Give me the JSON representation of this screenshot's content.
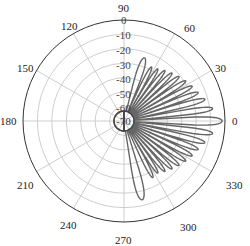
{
  "chart_data": {
    "type": "polar-line",
    "title": "",
    "theta_unit": "degrees",
    "angular_ticks": [
      0,
      30,
      60,
      90,
      120,
      150,
      180,
      210,
      240,
      270,
      300,
      330
    ],
    "radial_ticks": [
      0,
      -10,
      -20,
      -30,
      -40,
      -50,
      -60,
      -70
    ],
    "radial_range": [
      -70,
      0
    ],
    "radial_unit": "dB",
    "grid": true,
    "legend": null,
    "series": [
      {
        "name": "radiation pattern",
        "color": "#666666",
        "lobes": [
          {
            "angle": 0,
            "peak_db": -2,
            "half_width": 3.5
          },
          {
            "angle": 8,
            "peak_db": -8,
            "half_width": 2.6
          },
          {
            "angle": 15,
            "peak_db": -12,
            "half_width": 2.6
          },
          {
            "angle": 21,
            "peak_db": -15,
            "half_width": 2.6
          },
          {
            "angle": 27,
            "peak_db": -17,
            "half_width": 2.6
          },
          {
            "angle": 33,
            "peak_db": -19,
            "half_width": 2.6
          },
          {
            "angle": 39,
            "peak_db": -21,
            "half_width": 2.6
          },
          {
            "angle": 45,
            "peak_db": -23,
            "half_width": 2.6
          },
          {
            "angle": 51,
            "peak_db": -25,
            "half_width": 2.6
          },
          {
            "angle": 57,
            "peak_db": -27,
            "half_width": 2.6
          },
          {
            "angle": 63,
            "peak_db": -28,
            "half_width": 2.8
          },
          {
            "angle": 72,
            "peak_db": -24,
            "half_width": 4.5
          },
          {
            "angle": -8,
            "peak_db": -8,
            "half_width": 2.6
          },
          {
            "angle": -15,
            "peak_db": -12,
            "half_width": 2.6
          },
          {
            "angle": -21,
            "peak_db": -15,
            "half_width": 2.6
          },
          {
            "angle": -27,
            "peak_db": -17,
            "half_width": 2.6
          },
          {
            "angle": -33,
            "peak_db": -19,
            "half_width": 2.6
          },
          {
            "angle": -39,
            "peak_db": -21,
            "half_width": 2.6
          },
          {
            "angle": -45,
            "peak_db": -23,
            "half_width": 2.6
          },
          {
            "angle": -51,
            "peak_db": -25,
            "half_width": 2.6
          },
          {
            "angle": -57,
            "peak_db": -27,
            "half_width": 2.6
          },
          {
            "angle": -63,
            "peak_db": -26,
            "half_width": 2.8
          },
          {
            "angle": -77,
            "peak_db": -14,
            "half_width": 4.5
          }
        ],
        "floor_db": -63
      }
    ]
  },
  "labels": {
    "a0": "0",
    "a30": "30",
    "a60": "60",
    "a90": "90",
    "a120": "120",
    "a150": "150",
    "a180": "180",
    "a210": "210",
    "a240": "240",
    "a270": "270",
    "a300": "300",
    "a330": "330",
    "r0": "0",
    "r10": "-10",
    "r20": "-20",
    "r30": "-30",
    "r40": "-40",
    "r50": "-50",
    "r60": "-60",
    "r70": "-70"
  }
}
